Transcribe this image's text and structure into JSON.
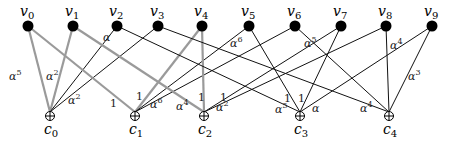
{
  "diagram": {
    "type": "tanner-graph",
    "variable_nodes": [
      {
        "id": "v0",
        "label": "v",
        "sub": "0",
        "x": 28,
        "y": 26
      },
      {
        "id": "v1",
        "label": "v",
        "sub": "1",
        "x": 73,
        "y": 26
      },
      {
        "id": "v2",
        "label": "v",
        "sub": "2",
        "x": 117,
        "y": 26
      },
      {
        "id": "v3",
        "label": "v",
        "sub": "3",
        "x": 158,
        "y": 26
      },
      {
        "id": "v4",
        "label": "v",
        "sub": "4",
        "x": 202,
        "y": 26
      },
      {
        "id": "v5",
        "label": "v",
        "sub": "5",
        "x": 249,
        "y": 26
      },
      {
        "id": "v6",
        "label": "v",
        "sub": "6",
        "x": 295,
        "y": 26
      },
      {
        "id": "v7",
        "label": "v",
        "sub": "7",
        "x": 341,
        "y": 26
      },
      {
        "id": "v8",
        "label": "v",
        "sub": "8",
        "x": 386,
        "y": 26
      },
      {
        "id": "v9",
        "label": "v",
        "sub": "9",
        "x": 432,
        "y": 26
      }
    ],
    "check_nodes": [
      {
        "id": "c0",
        "label": "c",
        "sub": "0",
        "x": 50,
        "y": 116
      },
      {
        "id": "c1",
        "label": "c",
        "sub": "1",
        "x": 135,
        "y": 116
      },
      {
        "id": "c2",
        "label": "c",
        "sub": "2",
        "x": 204,
        "y": 116
      },
      {
        "id": "c3",
        "label": "c",
        "sub": "3",
        "x": 300,
        "y": 116
      },
      {
        "id": "c4",
        "label": "c",
        "sub": "4",
        "x": 389,
        "y": 116
      }
    ],
    "edges": [
      {
        "from": "v0",
        "to": "c0",
        "style": "gray"
      },
      {
        "from": "v1",
        "to": "c0",
        "style": "gray"
      },
      {
        "from": "v2",
        "to": "c0",
        "style": "black"
      },
      {
        "from": "v3",
        "to": "c0",
        "style": "black"
      },
      {
        "from": "v0",
        "to": "c1",
        "style": "gray"
      },
      {
        "from": "v4",
        "to": "c1",
        "style": "gray"
      },
      {
        "from": "v5",
        "to": "c1",
        "style": "black"
      },
      {
        "from": "v6",
        "to": "c1",
        "style": "black"
      },
      {
        "from": "v1",
        "to": "c2",
        "style": "gray"
      },
      {
        "from": "v4",
        "to": "c2",
        "style": "gray"
      },
      {
        "from": "v7",
        "to": "c2",
        "style": "black"
      },
      {
        "from": "v8",
        "to": "c2",
        "style": "black"
      },
      {
        "from": "v2",
        "to": "c3",
        "style": "black"
      },
      {
        "from": "v5",
        "to": "c3",
        "style": "black"
      },
      {
        "from": "v7",
        "to": "c3",
        "style": "black"
      },
      {
        "from": "v9",
        "to": "c3",
        "style": "black"
      },
      {
        "from": "v3",
        "to": "c4",
        "style": "black"
      },
      {
        "from": "v6",
        "to": "c4",
        "style": "black"
      },
      {
        "from": "v8",
        "to": "c4",
        "style": "black"
      },
      {
        "from": "v9",
        "to": "c4",
        "style": "black"
      }
    ],
    "edge_labels": [
      {
        "base": "α",
        "sup": "5",
        "x": 9,
        "y": 80
      },
      {
        "base": "α",
        "sup": "2",
        "x": 46,
        "y": 80
      },
      {
        "base": "α",
        "sup": "",
        "x": 103,
        "y": 41
      },
      {
        "base": "α",
        "sup": "2",
        "x": 68,
        "y": 104
      },
      {
        "base": "1",
        "sup": "",
        "x": 110,
        "y": 107
      },
      {
        "base": "1",
        "sup": "",
        "x": 136,
        "y": 100
      },
      {
        "base": "α",
        "sup": "6",
        "x": 150,
        "y": 108
      },
      {
        "base": "α",
        "sup": "6",
        "x": 230,
        "y": 47
      },
      {
        "base": "α",
        "sup": "4",
        "x": 176,
        "y": 110
      },
      {
        "base": "1",
        "sup": "",
        "x": 198,
        "y": 101
      },
      {
        "base": "1",
        "sup": "",
        "x": 220,
        "y": 101
      },
      {
        "base": "α",
        "sup": "2",
        "x": 216,
        "y": 111
      },
      {
        "base": "α",
        "sup": "5",
        "x": 304,
        "y": 47
      },
      {
        "base": "1",
        "sup": "",
        "x": 284,
        "y": 102
      },
      {
        "base": "1",
        "sup": "",
        "x": 298,
        "y": 102
      },
      {
        "base": "α",
        "sup": "5",
        "x": 275,
        "y": 113
      },
      {
        "base": "α",
        "sup": "",
        "x": 312,
        "y": 112
      },
      {
        "base": "α",
        "sup": "4",
        "x": 360,
        "y": 112
      },
      {
        "base": "α",
        "sup": "4",
        "x": 390,
        "y": 49
      },
      {
        "base": "α",
        "sup": "3",
        "x": 408,
        "y": 80
      }
    ],
    "colors": {
      "gray_edge": "#9a9a9a",
      "black_edge": "#111111",
      "node": "#000000"
    }
  }
}
